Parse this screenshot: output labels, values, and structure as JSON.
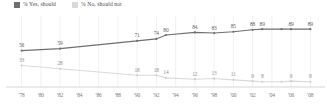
{
  "legend": {
    "items": [
      {
        "label": "% Yes, should",
        "color": "#6f6f6f",
        "key": "yes"
      },
      {
        "label": "% No, should not",
        "color": "#d9d9d9",
        "key": "no"
      }
    ]
  },
  "axis": {
    "ticks": [
      "'78",
      "'80",
      "'82",
      "'84",
      "'86",
      "'88",
      "'90",
      "'92",
      "'94",
      "'96",
      "'98",
      "'00",
      "'02",
      "'04",
      "'06",
      "'08"
    ]
  },
  "chart_data": {
    "type": "line",
    "title": "",
    "subtitle": "",
    "xlabel": "",
    "ylabel": "",
    "ylim": [
      0,
      100
    ],
    "xlim": [
      1977,
      2009
    ],
    "grid": true,
    "legend_position": "top-left",
    "x": [
      1978,
      1982,
      1990,
      1992,
      1993,
      1996,
      1998,
      2000,
      2002,
      2003,
      2005,
      2007,
      2008
    ],
    "series": [
      {
        "name": "% Yes, should",
        "color": "#6f6f6f",
        "points": [
          {
            "x": 1978,
            "y": 56,
            "label": "56"
          },
          {
            "x": 1982,
            "y": 59,
            "label": "59"
          },
          {
            "x": 1990,
            "y": 71,
            "label": "71"
          },
          {
            "x": 1992,
            "y": 74,
            "label": "74"
          },
          {
            "x": 1993,
            "y": 80,
            "label": "80"
          },
          {
            "x": 1996,
            "y": 84,
            "label": "84"
          },
          {
            "x": 1998,
            "y": 83,
            "label": "83"
          },
          {
            "x": 2000,
            "y": 85,
            "label": "85"
          },
          {
            "x": 2002,
            "y": 88,
            "label": "88"
          },
          {
            "x": 2003,
            "y": 89,
            "label": "89"
          },
          {
            "x": 2005,
            "y": 89,
            "label": ""
          },
          {
            "x": 2006,
            "y": 89,
            "label": "89"
          },
          {
            "x": 2008,
            "y": 89,
            "label": "89"
          }
        ]
      },
      {
        "name": "% No, should not",
        "color": "#d9d9d9",
        "points": [
          {
            "x": 1978,
            "y": 33,
            "label": "33"
          },
          {
            "x": 1982,
            "y": 28,
            "label": "28"
          },
          {
            "x": 1990,
            "y": 18,
            "label": "18"
          },
          {
            "x": 1992,
            "y": 18,
            "label": "18"
          },
          {
            "x": 1993,
            "y": 14,
            "label": "14"
          },
          {
            "x": 1996,
            "y": 12,
            "label": "12"
          },
          {
            "x": 1998,
            "y": 13,
            "label": "13"
          },
          {
            "x": 2000,
            "y": 11,
            "label": "11"
          },
          {
            "x": 2002,
            "y": 9,
            "label": "9"
          },
          {
            "x": 2003,
            "y": 8,
            "label": "8"
          },
          {
            "x": 2005,
            "y": 8,
            "label": ""
          },
          {
            "x": 2006,
            "y": 9,
            "label": "9"
          },
          {
            "x": 2008,
            "y": 8,
            "label": "8"
          }
        ]
      }
    ]
  }
}
